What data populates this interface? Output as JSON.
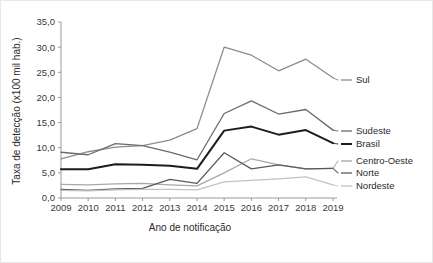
{
  "chart_data": {
    "type": "line",
    "title": "",
    "xlabel": "Ano de notificação",
    "ylabel": "Taxa de detecção (x100 mil hab.)",
    "categories": [
      "2009",
      "2010",
      "2011",
      "2012",
      "2013",
      "2014",
      "2015",
      "2016",
      "2017",
      "2018",
      "2019"
    ],
    "x": [
      2009,
      2010,
      2011,
      2012,
      2013,
      2014,
      2015,
      2016,
      2017,
      2018,
      2019
    ],
    "ylim": [
      0.0,
      35.0
    ],
    "ytick_labels": [
      "0,0",
      "5,0",
      "10,0",
      "15,0",
      "20,0",
      "25,0",
      "30,0",
      "35,0"
    ],
    "ytick_values": [
      0.0,
      5.0,
      10.0,
      15.0,
      20.0,
      25.0,
      30.0,
      35.0
    ],
    "grid": false,
    "legend_position": "right-outside",
    "series": [
      {
        "name": "Sul",
        "color": "#8c8c8c",
        "width": 1.3,
        "values": [
          7.8,
          9.2,
          10.1,
          10.4,
          11.5,
          13.8,
          30.0,
          28.4,
          25.3,
          27.6,
          23.9
        ]
      },
      {
        "name": "Sudeste",
        "color": "#6b6b6b",
        "width": 1.3,
        "values": [
          9.1,
          8.6,
          10.8,
          10.4,
          9.1,
          7.6,
          16.8,
          19.3,
          16.7,
          17.6,
          13.5
        ]
      },
      {
        "name": "Brasil",
        "color": "#1c1c1c",
        "width": 2.0,
        "values": [
          5.7,
          5.7,
          6.7,
          6.6,
          6.4,
          5.8,
          13.4,
          14.2,
          12.6,
          13.5,
          10.9
        ]
      },
      {
        "name": "Centro-Oeste",
        "color": "#a8a8a8",
        "width": 1.3,
        "values": [
          2.7,
          2.6,
          2.8,
          2.9,
          2.6,
          2.4,
          5.0,
          7.8,
          6.6,
          5.8,
          5.9
        ]
      },
      {
        "name": "Norte",
        "color": "#5a5a5a",
        "width": 1.3,
        "values": [
          1.7,
          1.5,
          1.8,
          1.9,
          3.7,
          2.9,
          9.0,
          5.8,
          6.6,
          5.8,
          5.9
        ]
      },
      {
        "name": "Nordeste",
        "color": "#c2c2c2",
        "width": 1.3,
        "values": [
          1.5,
          1.4,
          1.6,
          1.7,
          1.7,
          1.6,
          3.2,
          3.5,
          3.8,
          4.2,
          2.6
        ]
      }
    ]
  },
  "legend": {
    "items": [
      {
        "label": "Sul"
      },
      {
        "label": "Sudeste"
      },
      {
        "label": "Brasil"
      },
      {
        "label": "Centro-Oeste"
      },
      {
        "label": "Norte"
      },
      {
        "label": "Nordeste"
      }
    ]
  },
  "axes": {
    "x_title": "Ano de notificação",
    "y_title": "Taxa de detecção (x100 mil hab.)"
  }
}
